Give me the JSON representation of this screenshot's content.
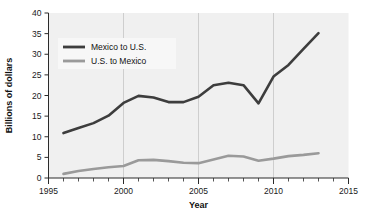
{
  "chart_data": {
    "type": "line",
    "title": "",
    "xlabel": "Year",
    "ylabel": "Billions of dollars",
    "xlim": [
      1995,
      2015
    ],
    "ylim": [
      0,
      40
    ],
    "xticks": [
      1995,
      2000,
      2005,
      2010,
      2015
    ],
    "xtick_labels": [
      "1995",
      "2000",
      "2005",
      "2010",
      "2015"
    ],
    "yticks": [
      0,
      5,
      10,
      15,
      20,
      25,
      30,
      35,
      40
    ],
    "ytick_labels": [
      "0",
      "5",
      "10",
      "15",
      "20",
      "25",
      "30",
      "35",
      "40"
    ],
    "minor_xtick_interval": 1,
    "grid": "vertical-only",
    "legend_position": "upper-left-inside",
    "series": [
      {
        "name": "Mexico to U.S.",
        "color": "#3d3d3d",
        "width": 2.6,
        "x": [
          1996,
          1997,
          1998,
          1999,
          2000,
          2001,
          2002,
          2003,
          2004,
          2005,
          2006,
          2007,
          2008,
          2009,
          2010,
          2011,
          2012,
          2013
        ],
        "values": [
          10.9,
          12.1,
          13.3,
          15.1,
          18.2,
          19.9,
          19.5,
          18.4,
          18.4,
          19.7,
          22.5,
          23.1,
          22.5,
          18.1,
          24.6,
          27.4,
          31.3,
          35.1
        ]
      },
      {
        "name": "U.S. to Mexico",
        "color": "#9a9a9a",
        "width": 2.6,
        "x": [
          1996,
          1997,
          1998,
          1999,
          2000,
          2001,
          2002,
          2003,
          2004,
          2005,
          2006,
          2007,
          2008,
          2009,
          2010,
          2011,
          2012,
          2013
        ],
        "values": [
          1.0,
          1.7,
          2.2,
          2.6,
          2.9,
          4.3,
          4.4,
          4.1,
          3.7,
          3.6,
          4.5,
          5.4,
          5.2,
          4.2,
          4.7,
          5.3,
          5.6,
          6.0
        ]
      }
    ],
    "legend": [
      {
        "label": "Mexico to U.S.",
        "color": "#3d3d3d"
      },
      {
        "label": "U.S. to Mexico",
        "color": "#9a9a9a"
      }
    ]
  }
}
